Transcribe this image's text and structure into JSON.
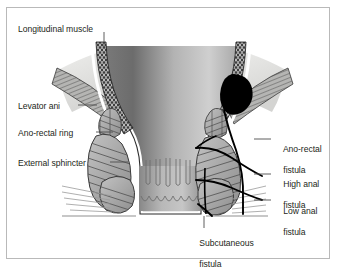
{
  "figure": {
    "type": "medical-anatomy-illustration",
    "frame_color": "#b9b9b9",
    "background": "#ffffff",
    "text_color": "#231f20"
  },
  "labels": {
    "left": [
      {
        "id": "longitudinal-muscle",
        "text": "Longitudinal muscle",
        "x": 18,
        "y": 24
      },
      {
        "id": "levator-ani",
        "text": "Levator ani",
        "x": 18,
        "y": 101
      },
      {
        "id": "ano-rectal-ring",
        "text": "Ano-rectal ring",
        "x": 18,
        "y": 128
      },
      {
        "id": "external-sphincter",
        "text": "External sphincter",
        "x": 18,
        "y": 158
      }
    ],
    "right": [
      {
        "id": "ano-rectal-fistula",
        "line1": "Ano-rectal",
        "line2": "fistula",
        "x": 274,
        "y": 134
      },
      {
        "id": "high-anal-fistula",
        "line1": "High anal",
        "line2": "fistula",
        "x": 274,
        "y": 169
      },
      {
        "id": "low-anal-fistula",
        "line1": "Low anal",
        "line2": "fistula",
        "x": 274,
        "y": 196
      }
    ],
    "bottom": [
      {
        "id": "subcutaneous-fistula",
        "line1": "Subcutaneous",
        "line2": "fistula",
        "x": 190,
        "y": 228
      }
    ]
  },
  "anatomy": {
    "structures": [
      "rectum-lumen",
      "anal-canal",
      "anal-columns",
      "longitudinal-muscle-band",
      "levator-ani-muscle",
      "external-sphincter-left",
      "external-sphincter-right",
      "internal-sphincter",
      "ischiorectal-fossa",
      "abscess"
    ],
    "colors": {
      "lumen_dark": "#6f6f6f",
      "lumen_light": "#c9c9c9",
      "muscle_fill": "#a9a9a9",
      "muscle_stroke": "#4a4a4a",
      "fossa_fill": "#e2e2e0",
      "abscess": "#000000",
      "fistula_tract": "#000000",
      "outline": "#2b2b2b"
    }
  }
}
